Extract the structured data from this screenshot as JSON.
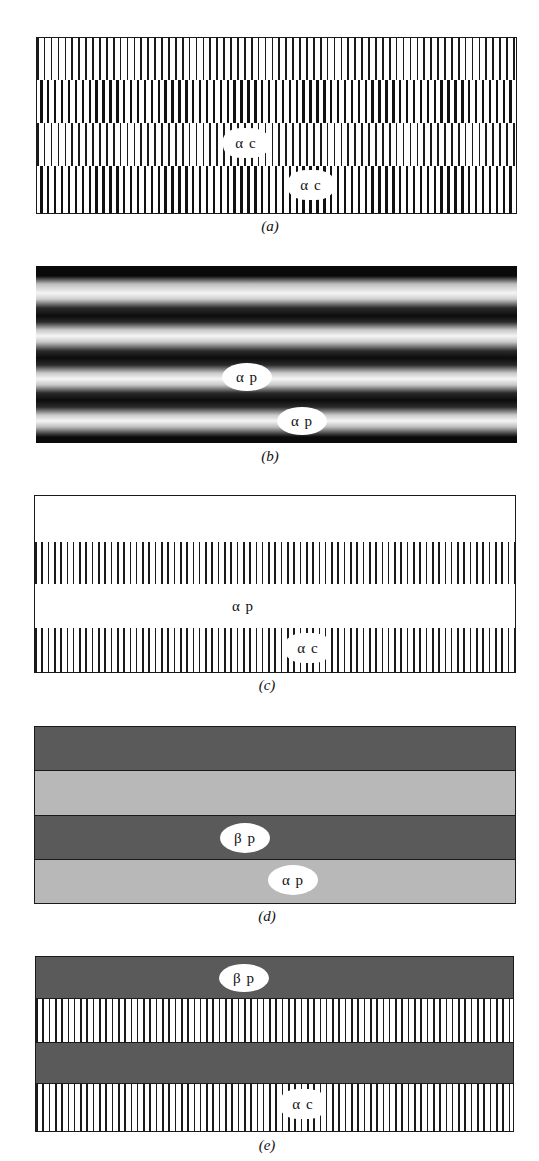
{
  "figure": {
    "panels": [
      {
        "id": "a",
        "caption": "(a)",
        "description": "Two interleaved lamellar (striped) colonies, alternating rows of thin and thick vertical lines",
        "labels": [
          "α c",
          "α c"
        ]
      },
      {
        "id": "b",
        "caption": "(b)",
        "description": "Smooth sinusoidal dark/light horizontal bands (modulated structure)",
        "labels": [
          "α p",
          "α p"
        ]
      },
      {
        "id": "c",
        "caption": "(c)",
        "description": "Alternating blank bands and vertically striped bands",
        "labels": [
          "α p",
          "α c"
        ]
      },
      {
        "id": "d",
        "caption": "(d)",
        "description": "Alternating dark gray and light gray solid bands",
        "labels": [
          "β p",
          "α p"
        ]
      },
      {
        "id": "e",
        "caption": "(e)",
        "description": "Alternating dark gray solid bands and vertically striped bands",
        "labels": [
          "β p",
          "α c"
        ]
      }
    ]
  },
  "colors": {
    "line": "#1a1a1a",
    "dark_band": "#5a5a5a",
    "light_band": "#b8b8b8",
    "background": "#ffffff"
  }
}
